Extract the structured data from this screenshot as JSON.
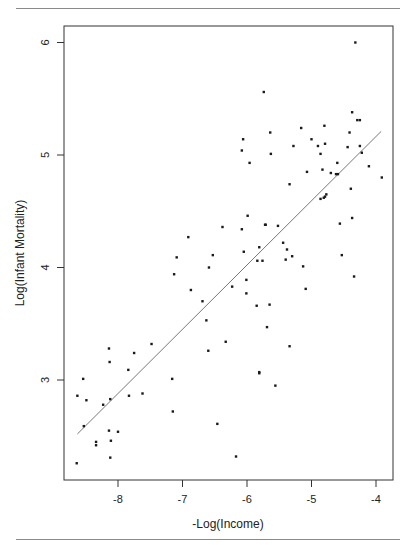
{
  "chart_data": {
    "type": "scatter",
    "title": "",
    "xlabel": "-Log(Income)",
    "ylabel": "Log(Infant Mortality)",
    "xlim": [
      -8.8,
      -3.7
    ],
    "ylim": [
      2.15,
      6.15
    ],
    "xticks": [
      -8,
      -7,
      -6,
      -5,
      -4
    ],
    "xtick_labels": [
      "-8",
      "-7",
      "-6",
      "-5",
      "-4"
    ],
    "yticks": [
      3,
      4,
      5,
      6
    ],
    "ytick_labels": [
      "3",
      "4",
      "5",
      "6"
    ],
    "grid": false,
    "legend": null,
    "fit_line": {
      "x": [
        -8.63,
        -3.92
      ],
      "y": [
        2.52,
        5.21
      ],
      "style": "solid-thin-gray"
    },
    "points": [
      [
        -8.14,
        3.28
      ],
      [
        -7.48,
        3.32
      ],
      [
        -7.75,
        3.24
      ],
      [
        -8.13,
        3.16
      ],
      [
        -7.84,
        3.09
      ],
      [
        -8.54,
        3.01
      ],
      [
        -7.16,
        3.01
      ],
      [
        -8.63,
        2.86
      ],
      [
        -8.49,
        2.82
      ],
      [
        -7.83,
        2.86
      ],
      [
        -7.62,
        2.88
      ],
      [
        -8.12,
        2.83
      ],
      [
        -8.23,
        2.78
      ],
      [
        -7.15,
        2.72
      ],
      [
        -8.53,
        2.59
      ],
      [
        -8.14,
        2.55
      ],
      [
        -8.0,
        2.54
      ],
      [
        -8.34,
        2.45
      ],
      [
        -8.34,
        2.42
      ],
      [
        -8.11,
        2.46
      ],
      [
        -8.12,
        2.31
      ],
      [
        -8.64,
        2.26
      ],
      [
        -6.38,
        4.36
      ],
      [
        -6.08,
        4.34
      ],
      [
        -5.71,
        4.38
      ],
      [
        -6.91,
        4.27
      ],
      [
        -5.81,
        4.18
      ],
      [
        -7.09,
        4.09
      ],
      [
        -6.53,
        4.11
      ],
      [
        -6.05,
        4.14
      ],
      [
        -5.84,
        4.06
      ],
      [
        -5.76,
        4.06
      ],
      [
        -6.59,
        4.0
      ],
      [
        -7.13,
        3.94
      ],
      [
        -6.01,
        3.89
      ],
      [
        -6.87,
        3.8
      ],
      [
        -6.23,
        3.83
      ],
      [
        -6.01,
        3.77
      ],
      [
        -6.69,
        3.7
      ],
      [
        -5.85,
        3.66
      ],
      [
        -5.65,
        3.67
      ],
      [
        -6.63,
        3.53
      ],
      [
        -5.69,
        3.47
      ],
      [
        -6.33,
        3.34
      ],
      [
        -6.6,
        3.26
      ],
      [
        -6.08,
        5.04
      ],
      [
        -5.63,
        5.01
      ],
      [
        -5.28,
        5.08
      ],
      [
        -5.96,
        4.93
      ],
      [
        -5.07,
        4.85
      ],
      [
        -5.34,
        4.74
      ],
      [
        -5.99,
        4.46
      ],
      [
        -5.52,
        4.37
      ],
      [
        -5.74,
        5.56
      ],
      [
        -4.8,
        5.26
      ],
      [
        -5.16,
        5.24
      ],
      [
        -5.64,
        5.2
      ],
      [
        -6.06,
        5.14
      ],
      [
        -5.0,
        5.14
      ],
      [
        -4.9,
        5.08
      ],
      [
        -4.79,
        5.1
      ],
      [
        -4.86,
        5.01
      ],
      [
        -4.32,
        6.0
      ],
      [
        -4.37,
        5.38
      ],
      [
        -4.29,
        5.31
      ],
      [
        -4.25,
        5.31
      ],
      [
        -4.41,
        5.2
      ],
      [
        -4.44,
        5.07
      ],
      [
        -4.25,
        5.08
      ],
      [
        -4.22,
        5.02
      ],
      [
        -4.6,
        4.93
      ],
      [
        -4.11,
        4.9
      ],
      [
        -4.83,
        4.87
      ],
      [
        -4.7,
        4.84
      ],
      [
        -4.62,
        4.83
      ],
      [
        -4.59,
        4.83
      ],
      [
        -3.91,
        4.8
      ],
      [
        -4.39,
        4.7
      ],
      [
        -4.77,
        4.65
      ],
      [
        -4.79,
        4.63
      ],
      [
        -4.81,
        4.62
      ],
      [
        -4.86,
        4.61
      ],
      [
        -4.37,
        4.44
      ],
      [
        -4.56,
        4.39
      ],
      [
        -4.53,
        4.11
      ],
      [
        -5.13,
        4.01
      ],
      [
        -5.72,
        4.38
      ],
      [
        -5.44,
        4.22
      ],
      [
        -5.38,
        4.16
      ],
      [
        -5.4,
        4.07
      ],
      [
        -5.3,
        4.1
      ],
      [
        -4.34,
        3.92
      ],
      [
        -5.09,
        3.81
      ],
      [
        -5.34,
        3.3
      ],
      [
        -5.81,
        3.07
      ],
      [
        -5.81,
        3.06
      ],
      [
        -5.56,
        2.95
      ],
      [
        -6.46,
        2.61
      ],
      [
        -6.17,
        2.32
      ]
    ]
  },
  "colors": {
    "axis": "#333333",
    "point": "#1a1a1a",
    "fit_line": "#777777",
    "rule": "#8a8a8a"
  }
}
